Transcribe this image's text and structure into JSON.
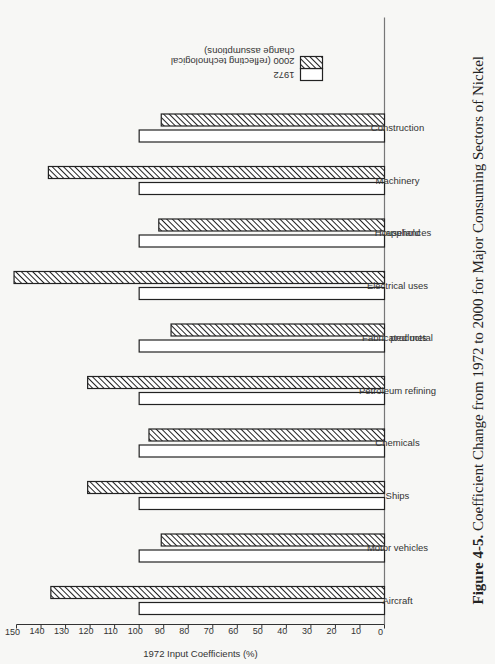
{
  "chart_data": {
    "type": "bar",
    "orientation": "rotated-90ccw (vertical bar chart printed sideways)",
    "title": "Figure 4-5. Coefficient Change from 1972 to 2000 for Major Consuming Sectors of Nickel",
    "figure_label": "Figure 4-5.",
    "caption_text": "Coefficient Change from 1972 to 2000 for Major Consuming Sectors of Nickel",
    "xlabel": "",
    "ylabel": "1972 Input Coefficients (%)",
    "ylim": [
      0,
      150
    ],
    "yticks": [
      0,
      10,
      20,
      30,
      40,
      50,
      60,
      70,
      80,
      90,
      100,
      110,
      120,
      130,
      140,
      150
    ],
    "grid": false,
    "legend_position": "upper-right (top of page)",
    "categories": [
      [
        "Aircraft"
      ],
      [
        "Motor vehicles"
      ],
      [
        "Ships"
      ],
      [
        "Chemicals"
      ],
      [
        "Petroleum refining"
      ],
      [
        "Fabricated metal",
        "products"
      ],
      [
        "Electrical uses"
      ],
      [
        "Household",
        "appliances"
      ],
      [
        "Machinery"
      ],
      [
        "Construction"
      ]
    ],
    "category_names": [
      "Aircraft",
      "Motor vehicles",
      "Ships",
      "Chemicals",
      "Petroleum refining",
      "Fabricated metal products",
      "Electrical uses",
      "Household appliances",
      "Machinery",
      "Construction"
    ],
    "series": [
      {
        "name": "1972",
        "pattern": "open",
        "values": [
          100,
          100,
          100,
          100,
          100,
          100,
          100,
          100,
          100,
          100
        ]
      },
      {
        "name": "2000 (reflecting technological change assumptions)",
        "pattern": "hatched",
        "values": [
          136,
          91,
          121,
          96,
          121,
          87,
          151,
          92,
          137,
          91
        ]
      }
    ],
    "legend": [
      {
        "label_lines": [
          "1972"
        ],
        "pattern": "open"
      },
      {
        "label_lines": [
          "2000 (reflecting technological",
          "change assumptions)"
        ],
        "pattern": "hatched"
      }
    ]
  },
  "colors": {
    "background": "#f7f7f5",
    "ink": "#222222",
    "bar_fill_open": "#ffffff",
    "hatch": "#222222"
  }
}
